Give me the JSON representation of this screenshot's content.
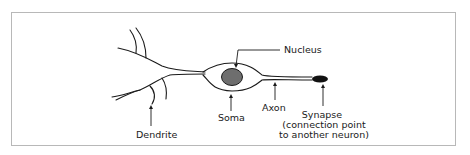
{
  "diagram": {
    "labels": {
      "nucleus": "Nucleus",
      "soma": "Soma",
      "axon": "Axon",
      "dendrite": "Dendrite",
      "synapse_line1": "Synapse",
      "synapse_line2": "(connection point",
      "synapse_line3": "to another neuron)"
    },
    "colors": {
      "stroke": "#1a1a1a",
      "nucleus_fill": "#6e6e6e",
      "synapse_fill": "#111111",
      "frame": "#b8b8b8"
    }
  }
}
